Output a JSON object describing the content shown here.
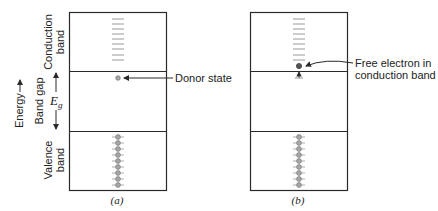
{
  "axis": {
    "energy_label": "Energy",
    "band_gap_label": "Band gap",
    "eg_symbol": "E",
    "eg_subscript": "g"
  },
  "bands": {
    "conduction_label_line1": "Conduction",
    "conduction_label_line2": "band",
    "valence_label_line1": "Valence",
    "valence_label_line2": "band"
  },
  "panels": [
    {
      "caption": "(a)",
      "annotation_lines": [
        "Donor state"
      ],
      "conduction_level_count": 9,
      "valence_electron_count": 9,
      "donor_state": "occupied"
    },
    {
      "caption": "(b)",
      "annotation_lines": [
        "Free electron in",
        "conduction band"
      ],
      "conduction_level_count": 9,
      "valence_electron_count": 9,
      "donor_state": "ionized"
    }
  ],
  "colors": {
    "line": "#2a2a2a",
    "level": "#9a9a9a",
    "electron_fill": "#a8a8a8",
    "electron_stroke": "#777777",
    "free_electron": "#555555"
  }
}
